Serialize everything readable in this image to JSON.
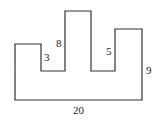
{
  "diagram": {
    "type": "rectilinear-polygon",
    "stroke_color": "#333333",
    "background": "#ffffff",
    "points": "15,44 41,44 41,71 65,71 65,11 91,11 91,71 115,71 115,29 142,29 142,100 15,100",
    "labels": {
      "left_notch": "3",
      "middle_prong": "8",
      "right_notch": "5",
      "right_side": "9",
      "bottom": "20"
    }
  }
}
